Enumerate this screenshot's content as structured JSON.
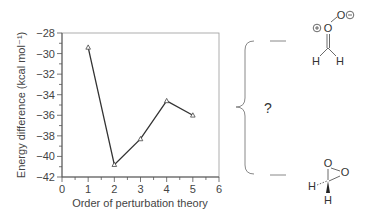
{
  "chart_data": {
    "type": "line",
    "title": "",
    "xlabel": "Order of perturbation theory",
    "ylabel": "Energy difference (kcal mol⁻¹)",
    "x": [
      1,
      2,
      3,
      4,
      5
    ],
    "values": [
      -29.4,
      -40.8,
      -38.3,
      -34.6,
      -36.0
    ],
    "xlim": [
      0,
      6
    ],
    "ylim": [
      -42,
      -28
    ],
    "xticks": [
      0,
      1,
      2,
      3,
      4,
      5,
      6
    ],
    "yticks": [
      -28,
      -30,
      -32,
      -34,
      -36,
      -38,
      -40,
      -42
    ],
    "grid": false,
    "marker": "open-triangle",
    "line_color": "#333333"
  },
  "annotations": {
    "question_mark": "?",
    "top_structure": {
      "name": "carbonyl oxide",
      "atoms": [
        "O",
        "O",
        "H",
        "H"
      ],
      "charges": [
        "⊕",
        "⊖"
      ]
    },
    "bottom_structure": {
      "name": "dioxirane",
      "atoms": [
        "O",
        "O",
        "H",
        "H"
      ]
    }
  }
}
